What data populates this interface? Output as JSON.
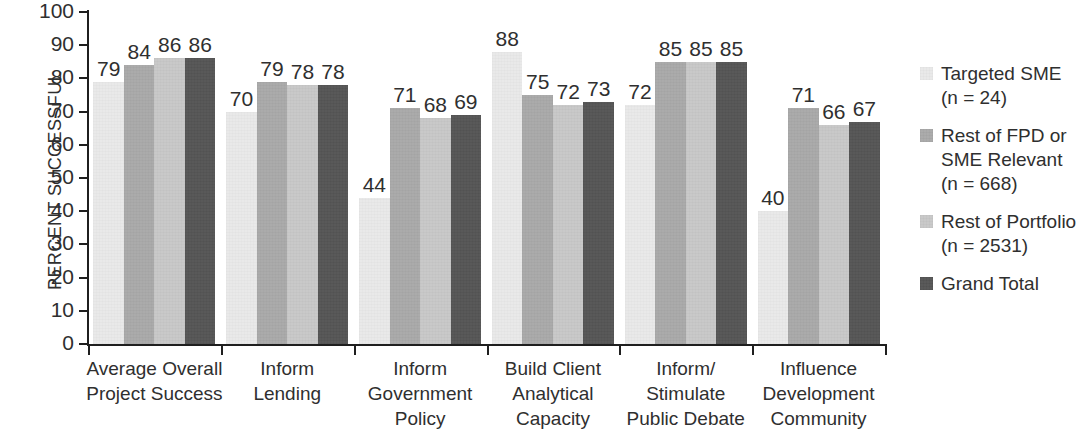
{
  "chart_data": {
    "type": "bar",
    "title": "",
    "subtitle": "",
    "xlabel": "",
    "ylabel": "PERCENT SUCCESSFUL",
    "ylim": [
      0,
      100
    ],
    "y_ticks": [
      0,
      10,
      20,
      30,
      40,
      50,
      60,
      70,
      80,
      90,
      100
    ],
    "grid": false,
    "legend_position": "right",
    "orientation": "vertical",
    "grouping": "grouped",
    "categories": [
      "Average Overall\nProject Success",
      "Inform\nLending",
      "Inform\nGovernment\nPolicy",
      "Build Client\nAnalytical\nCapacity",
      "Inform/\nStimulate\nPublic Debate",
      "Influence\nDevelopment\nCommunity"
    ],
    "series": [
      {
        "name": "Targeted SME\n(n = 24)",
        "short_name": "Targeted SME",
        "sample_size": "n = 24",
        "color": "#e9e9e9",
        "values": [
          79,
          70,
          44,
          88,
          72,
          40
        ]
      },
      {
        "name": "Rest of FPD or\nSME Relevant\n(n = 668)",
        "short_name": "Rest of FPD or SME Relevant",
        "sample_size": "n = 668",
        "color": "#a9a9a9",
        "values": [
          84,
          79,
          71,
          75,
          85,
          71
        ]
      },
      {
        "name": "Rest of Portfolio\n(n = 2531)",
        "short_name": "Rest of Portfolio",
        "sample_size": "n = 2531",
        "color": "#c8c8c8",
        "values": [
          86,
          78,
          68,
          72,
          85,
          66
        ]
      },
      {
        "name": "Grand Total",
        "short_name": "Grand Total",
        "sample_size": "",
        "color": "#555555",
        "values": [
          86,
          78,
          69,
          73,
          85,
          67
        ]
      }
    ]
  },
  "axis": {
    "y_title": "PERCENT SUCCESSFUL",
    "tick_labels": [
      "100",
      "90",
      "80",
      "70",
      "60",
      "50",
      "40",
      "30",
      "20",
      "10",
      "0"
    ]
  },
  "legend": {
    "items": [
      {
        "label": "Targeted SME\n(n = 24)",
        "color": "#e9e9e9"
      },
      {
        "label": "Rest of FPD or\nSME Relevant\n(n = 668)",
        "color": "#a9a9a9"
      },
      {
        "label": "Rest of Portfolio\n(n = 2531)",
        "color": "#c8c8c8"
      },
      {
        "label": "Grand Total",
        "color": "#555555"
      }
    ]
  }
}
